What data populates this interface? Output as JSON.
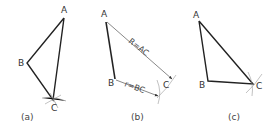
{
  "figure": {
    "panels": [
      {
        "caption": "(a)",
        "points": {
          "A": "A",
          "B": "B",
          "C": "C"
        }
      },
      {
        "caption": "(b)",
        "points": {
          "A": "A",
          "B": "B",
          "C": "C"
        },
        "dimensions": {
          "long": "R=AC",
          "short": "r=BC"
        }
      },
      {
        "caption": "(c)",
        "points": {
          "A": "A",
          "B": "B",
          "C": "C"
        }
      }
    ],
    "colors": {
      "line": "#222222",
      "construction": "#888888",
      "text": "#333333"
    }
  }
}
